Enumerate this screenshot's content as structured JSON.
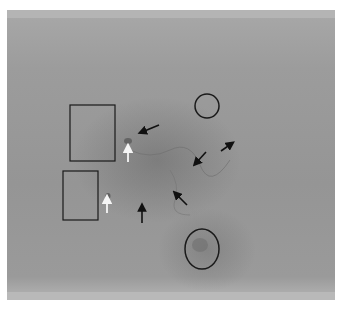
{
  "image": {
    "description": "Grayscale fundus angiography image with annotations",
    "annotations": {
      "rectangles": [
        {
          "name": "rect-upper-left",
          "x": 70,
          "y": 105,
          "w": 45,
          "h": 56
        },
        {
          "name": "rect-lower-left",
          "x": 63,
          "y": 171,
          "w": 35,
          "h": 49
        }
      ],
      "ellipses": [
        {
          "name": "circle-upper-right",
          "cx": 207,
          "cy": 106,
          "rx": 12,
          "ry": 12
        },
        {
          "name": "circle-lower",
          "cx": 202,
          "cy": 249,
          "rx": 17,
          "ry": 20
        }
      ],
      "black_arrows": [
        {
          "name": "arrow-1",
          "x1": 159,
          "y1": 125,
          "x2": 142,
          "y2": 132
        },
        {
          "name": "arrow-2",
          "x1": 142,
          "y1": 223,
          "x2": 142,
          "y2": 207
        },
        {
          "name": "arrow-3",
          "x1": 206,
          "y1": 152,
          "x2": 196,
          "y2": 163
        },
        {
          "name": "arrow-4",
          "x1": 221,
          "y1": 151,
          "x2": 231,
          "y2": 144
        },
        {
          "name": "arrow-5",
          "x1": 187,
          "y1": 205,
          "x2": 176,
          "y2": 194
        }
      ],
      "white_arrows": [
        {
          "name": "white-arrow-1",
          "x1": 128,
          "y1": 162,
          "x2": 128,
          "y2": 148
        },
        {
          "name": "white-arrow-2",
          "x1": 107,
          "y1": 213,
          "x2": 107,
          "y2": 199
        }
      ]
    }
  }
}
